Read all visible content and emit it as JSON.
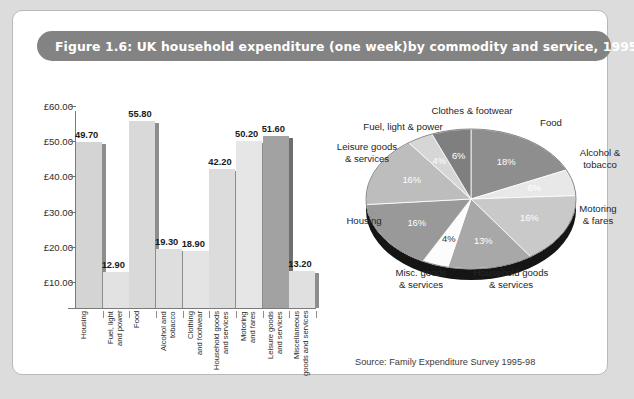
{
  "figure": {
    "title": "Figure 1.6: UK household expenditure (one week)by commodity and service, 1995-8",
    "source": "Source: Family Expenditure Survey 1995-98",
    "title_bar_color": "#838383",
    "page_background": "#ffffff"
  },
  "chart_data": [
    {
      "type": "bar",
      "title": "UK household expenditure (one week) by commodity and service, 1995-8",
      "xlabel": "",
      "ylabel": "",
      "ylim": [
        2.65,
        62.0
      ],
      "grid": false,
      "categories": [
        "Housing",
        "Fuel, light\nand power",
        "Food",
        "Alcohol and\ntobacco",
        "Clothing\nand footwear",
        "Household goods\nand services",
        "Motoring\nand fares",
        "Leisure goods\nand services",
        "Miscellaneous\ngoods and services"
      ],
      "values": [
        49.7,
        12.9,
        55.8,
        19.3,
        18.9,
        42.2,
        50.2,
        51.6,
        13.2
      ],
      "value_labels": [
        "49.70",
        "12.90",
        "55.80",
        "19.30",
        "18.90",
        "42.20",
        "50.20",
        "51.60",
        "13.20"
      ],
      "bar_colors": [
        "#d4d4d4",
        "#e2e2e2",
        "#d9d9d9",
        "#dedede",
        "#e4e4e4",
        "#dcdcdc",
        "#e6e6e6",
        "#a2a2a2",
        "#e0e0e0"
      ],
      "axis": {
        "ticks": [
          10,
          20,
          30,
          40,
          50,
          60
        ],
        "tick_labels": [
          "£10.00",
          "£20.00",
          "£30.00",
          "£40.00",
          "£50.00",
          "£60.00"
        ],
        "currency": "£"
      }
    },
    {
      "type": "pie",
      "title": "UK household expenditure by commodity and service",
      "legend": "outside",
      "labels": [
        "Food",
        "Alcohol &\ntobacco",
        "Motoring\n& fares",
        "Household goods\n& services",
        "Misc. goods\n& services",
        "Housing",
        "Leisure goods\n& services",
        "Fuel, light & power",
        "Clothes & footwear"
      ],
      "values": [
        18,
        6,
        16,
        13,
        4,
        16,
        16,
        4,
        6
      ],
      "value_labels": [
        "18%",
        "6%",
        "16%",
        "13%",
        "4%",
        "16%",
        "16%",
        "4%",
        "6%"
      ],
      "slice_colors": [
        "#8e8e8e",
        "#e8e8e8",
        "#c9c9c9",
        "#a8a8a8",
        "#fcfcfc",
        "#999999",
        "#bdbdbd",
        "#d6d6d6",
        "#7f7f7f"
      ]
    }
  ]
}
